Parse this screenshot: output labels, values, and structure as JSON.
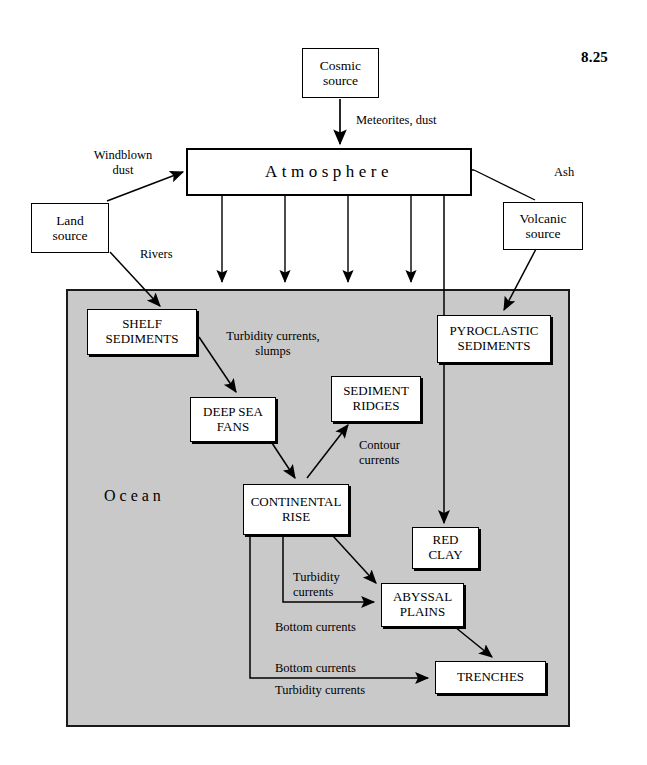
{
  "figure": {
    "number": "8.25"
  },
  "nodes": {
    "cosmic_source": "Cosmic\nsource",
    "cosmic_source_l1": "Cosmic",
    "cosmic_source_l2": "source",
    "atmosphere": "Atmosphere",
    "land_source_l1": "Land",
    "land_source_l2": "source",
    "volcanic_source_l1": "Volcanic",
    "volcanic_source_l2": "source",
    "shelf_sediments_l1": "SHELF",
    "shelf_sediments_l2": "SEDIMENTS",
    "pyroclastic_sediments_l1": "PYROCLASTIC",
    "pyroclastic_sediments_l2": "SEDIMENTS",
    "deep_sea_fans_l1": "DEEP SEA",
    "deep_sea_fans_l2": "FANS",
    "sediment_ridges_l1": "SEDIMENT",
    "sediment_ridges_l2": "RIDGES",
    "continental_rise_l1": "CONTINENTAL",
    "continental_rise_l2": "RISE",
    "red_clay_l1": "RED",
    "red_clay_l2": "CLAY",
    "abyssal_plains_l1": "ABYSSAL",
    "abyssal_plains_l2": "PLAINS",
    "trenches": "TRENCHES",
    "ocean": "Ocean"
  },
  "edge_labels": {
    "meteorites_dust": "Meteorites, dust",
    "windblown_l1": "Windblown",
    "windblown_l2": "dust",
    "ash": "Ash",
    "rivers": "Rivers",
    "turbidity_slumps_l1": "Turbidity currents,",
    "turbidity_slumps_l2": "slumps",
    "contour_l1": "Contour",
    "contour_l2": "currents",
    "turbidity_l1": "Turbidity",
    "turbidity_l2": "currents",
    "bottom_currents_mid": "Bottom currents",
    "bottom_currents_low": "Bottom currents",
    "turbidity_currents_low": "Turbidity currents"
  },
  "colors": {
    "ocean_fill": "#c9c9c9",
    "box_fill": "#ffffff",
    "stroke": "#000000",
    "page_bg": "#ffffff"
  },
  "diagram": {
    "type": "flow-diagram",
    "flows": [
      {
        "from": "Cosmic source",
        "to": "Atmosphere",
        "label": "Meteorites, dust"
      },
      {
        "from": "Land source",
        "to": "Atmosphere",
        "label": "Windblown dust"
      },
      {
        "from": "Volcanic source",
        "to": "Atmosphere",
        "label": "Ash"
      },
      {
        "from": "Atmosphere",
        "to": "Ocean",
        "label": ""
      },
      {
        "from": "Atmosphere",
        "to": "Red clay",
        "label": ""
      },
      {
        "from": "Land source",
        "to": "Shelf sediments",
        "label": "Rivers"
      },
      {
        "from": "Volcanic source",
        "to": "Pyroclastic sediments",
        "label": ""
      },
      {
        "from": "Shelf sediments",
        "to": "Deep sea fans",
        "label": "Turbidity currents, slumps"
      },
      {
        "from": "Deep sea fans",
        "to": "Continental rise",
        "label": ""
      },
      {
        "from": "Continental rise",
        "to": "Sediment ridges",
        "label": "Contour currents"
      },
      {
        "from": "Continental rise",
        "to": "Abyssal plains",
        "label": "Turbidity currents"
      },
      {
        "from": "Continental rise",
        "to": "Abyssal plains",
        "label": "Bottom currents"
      },
      {
        "from": "Continental rise",
        "to": "Trenches",
        "label": "Bottom currents / Turbidity currents"
      },
      {
        "from": "Abyssal plains",
        "to": "Trenches",
        "label": ""
      }
    ]
  }
}
